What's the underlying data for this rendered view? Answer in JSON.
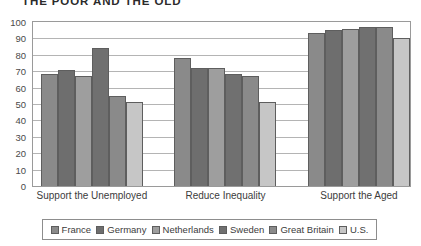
{
  "chart_data": {
    "type": "bar",
    "title": "THE POOR AND THE OLD",
    "xlabel": "",
    "ylabel": "",
    "ylim": [
      0,
      100
    ],
    "ytick_step": 10,
    "yticks": [
      100,
      90,
      80,
      70,
      60,
      50,
      40,
      30,
      20,
      10,
      0
    ],
    "grid": true,
    "legend_position": "bottom",
    "categories": [
      "Support the Unemployed",
      "Reduce Inequality",
      "Support the Aged"
    ],
    "series": [
      {
        "name": "France",
        "color": "#8a8a8a",
        "values": [
          68,
          78,
          93
        ]
      },
      {
        "name": "Germany",
        "color": "#6e6e6e",
        "values": [
          71,
          72,
          95
        ]
      },
      {
        "name": "Netherlands",
        "color": "#9e9e9e",
        "values": [
          67,
          72,
          96
        ]
      },
      {
        "name": "Sweden",
        "color": "#707070",
        "values": [
          84,
          68,
          97
        ]
      },
      {
        "name": "Great Britain",
        "color": "#8a8a8a",
        "values": [
          55,
          67,
          97
        ]
      },
      {
        "name": "U.S.",
        "color": "#c6c6c6",
        "values": [
          51,
          51,
          90
        ]
      }
    ]
  }
}
